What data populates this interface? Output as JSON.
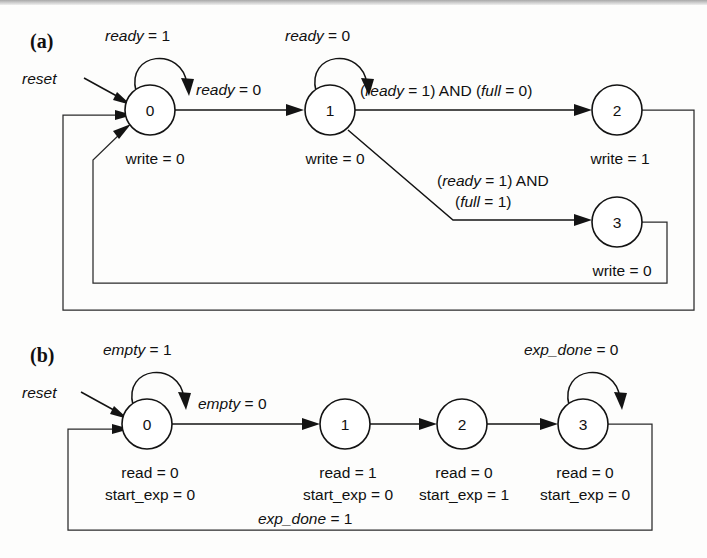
{
  "figure": {
    "type": "state-transition-diagram-pair",
    "panels": [
      {
        "id": "a",
        "label": "(a)",
        "reset_label": "reset",
        "states": [
          {
            "name": "0",
            "outputs": [
              "write = 0"
            ]
          },
          {
            "name": "1",
            "outputs": [
              "write = 0"
            ]
          },
          {
            "name": "2",
            "outputs": [
              "write = 1"
            ]
          },
          {
            "name": "3",
            "outputs": [
              "write = 0"
            ]
          }
        ],
        "self_loops": [
          {
            "state": "0",
            "label": "ready = 1"
          },
          {
            "state": "1",
            "label": "ready = 0"
          }
        ],
        "transitions": [
          {
            "from": "0",
            "to": "1",
            "label": "ready = 0"
          },
          {
            "from": "1",
            "to": "2",
            "label": "(ready = 1) AND (full = 0)"
          },
          {
            "from": "1",
            "to": "3",
            "label_line1": "(ready = 1) AND",
            "label_line2": "(full = 1)"
          },
          {
            "from": "2",
            "to": "0",
            "label": ""
          },
          {
            "from": "3",
            "to": "0",
            "label": ""
          }
        ]
      },
      {
        "id": "b",
        "label": "(b)",
        "reset_label": "reset",
        "states": [
          {
            "name": "0",
            "outputs": [
              "read = 0",
              "start_exp = 0"
            ]
          },
          {
            "name": "1",
            "outputs": [
              "read = 1",
              "start_exp = 0"
            ]
          },
          {
            "name": "2",
            "outputs": [
              "read = 0",
              "start_exp = 1"
            ]
          },
          {
            "name": "3",
            "outputs": [
              "read = 0",
              "start_exp = 0"
            ]
          }
        ],
        "self_loops": [
          {
            "state": "0",
            "label": "empty = 1"
          },
          {
            "state": "3",
            "label": "exp_done = 0"
          }
        ],
        "transitions": [
          {
            "from": "0",
            "to": "1",
            "label": "empty = 0"
          },
          {
            "from": "1",
            "to": "2",
            "label": ""
          },
          {
            "from": "2",
            "to": "3",
            "label": ""
          },
          {
            "from": "3",
            "to": "0",
            "label": "exp_done = 1"
          }
        ]
      }
    ],
    "colors": {
      "ink": "#131313",
      "paper": "#fdfdfc"
    }
  },
  "text": {
    "a": {
      "panel": "(a)",
      "reset": "reset",
      "loop0": "ready = 1",
      "loop0_var": "ready",
      "loop0_rest": " = 1",
      "loop1_var": "ready",
      "loop1_rest": " = 0",
      "t01_var": "ready",
      "t01_rest": " = 0",
      "t12_a": "(",
      "t12_var1": "ready",
      "t12_mid": " = 1) AND (",
      "t12_var2": "full",
      "t12_end": " = 0)",
      "t13_l1_a": "(",
      "t13_l1_var": "ready",
      "t13_l1_end": " = 1) AND",
      "t13_l2_a": "(",
      "t13_l2_var": "full",
      "t13_l2_end": " = 1)",
      "s0": "0",
      "s1": "1",
      "s2": "2",
      "s3": "3",
      "o0_var": "write",
      "o0_rest": " = 0",
      "o1_var": "write",
      "o1_rest": " = 0",
      "o2_var": "write",
      "o2_rest": " = 1",
      "o3_var": "write",
      "o3_rest": " = 0"
    },
    "b": {
      "panel": "(b)",
      "reset": "reset",
      "loop0_var": "empty",
      "loop0_rest": " = 1",
      "loop3_var": "exp_done",
      "loop3_rest": " = 0",
      "t01_var": "empty",
      "t01_rest": " = 0",
      "t30_var": "exp_done",
      "t30_rest": " = 1",
      "s0": "0",
      "s1": "1",
      "s2": "2",
      "s3": "3",
      "o0a_var": "read",
      "o0a_rest": " = 0",
      "o0b_var": "start_exp",
      "o0b_rest": " = 0",
      "o1a_var": "read",
      "o1a_rest": " = 1",
      "o1b_var": "start_exp",
      "o1b_rest": " = 0",
      "o2a_var": "read",
      "o2a_rest": " = 0",
      "o2b_var": "start_exp",
      "o2b_rest": " = 1",
      "o3a_var": "read",
      "o3a_rest": " = 0",
      "o3b_var": "start_exp",
      "o3b_rest": " = 0"
    }
  }
}
